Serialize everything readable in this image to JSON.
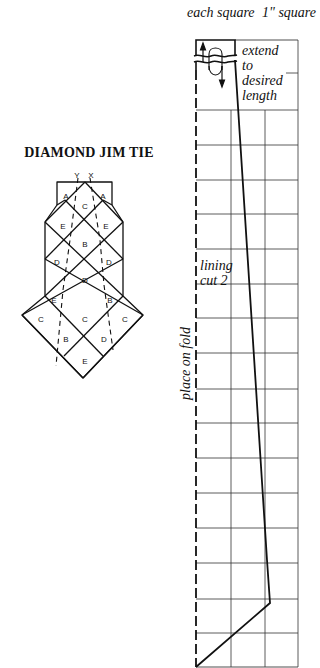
{
  "diagram": {
    "title": "DIAMOND JIM TIE",
    "tie_labels": {
      "y_line": "Y",
      "x_line": "X",
      "pieces": [
        {
          "label": "A",
          "x": 66,
          "y": 196
        },
        {
          "label": "A",
          "x": 103,
          "y": 196
        },
        {
          "label": "C",
          "x": 85,
          "y": 206
        },
        {
          "label": "E",
          "x": 63,
          "y": 226
        },
        {
          "label": "E",
          "x": 106,
          "y": 226
        },
        {
          "label": "B",
          "x": 85,
          "y": 244
        },
        {
          "label": "D",
          "x": 57,
          "y": 262
        },
        {
          "label": "D",
          "x": 109,
          "y": 262
        },
        {
          "label": "D",
          "x": 85,
          "y": 280
        },
        {
          "label": "E",
          "x": 54,
          "y": 300
        },
        {
          "label": "B",
          "x": 110,
          "y": 300
        },
        {
          "label": "C",
          "x": 41,
          "y": 319
        },
        {
          "label": "C",
          "x": 85,
          "y": 319
        },
        {
          "label": "C",
          "x": 125,
          "y": 319
        },
        {
          "label": "B",
          "x": 66,
          "y": 339
        },
        {
          "label": "D",
          "x": 104,
          "y": 339
        },
        {
          "label": "E",
          "x": 85,
          "y": 361
        }
      ]
    },
    "pattern": {
      "scale_note_left": "each square",
      "scale_note_right": "1\" square",
      "extend_note": [
        "extend",
        "to",
        "desired",
        "length"
      ],
      "lining_note": [
        "lining",
        "cut 2"
      ],
      "fold_note": "place on fold",
      "grid": {
        "x_lines": [
          196,
          231,
          265,
          298
        ],
        "y_lines": [
          40,
          110,
          145,
          180,
          214,
          249,
          284,
          318,
          353,
          389,
          423,
          458,
          493,
          528,
          563,
          599,
          633,
          667
        ]
      },
      "outline_points": [
        [
          235,
          60
        ],
        [
          267,
          560
        ],
        [
          270,
          603
        ],
        [
          196,
          667
        ]
      ]
    }
  }
}
